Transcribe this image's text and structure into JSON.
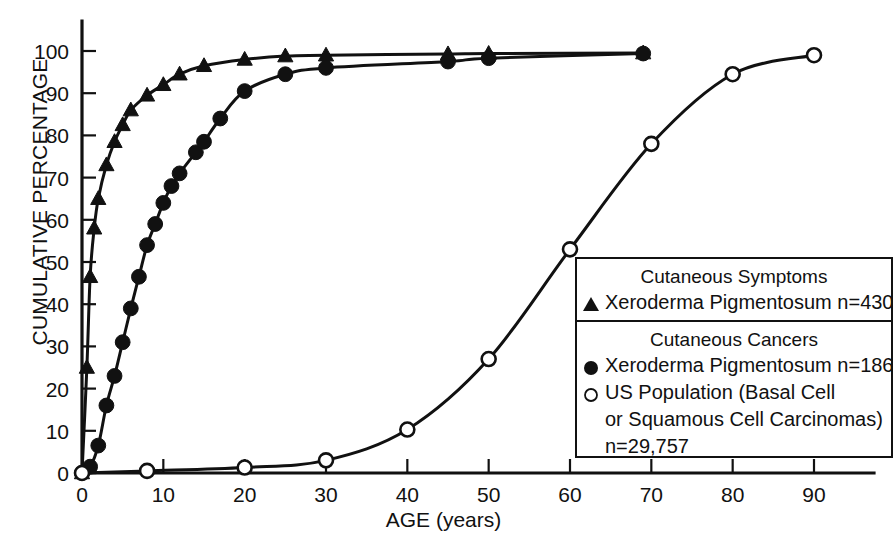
{
  "chart_data": {
    "type": "line",
    "title": "",
    "xlabel": "AGE (years)",
    "ylabel": "CUMULATIVE PERCENTAGE",
    "xlim": [
      0,
      95
    ],
    "ylim": [
      0,
      103
    ],
    "xticks": [
      0,
      10,
      20,
      30,
      40,
      50,
      60,
      70,
      80,
      90
    ],
    "yticks": [
      0,
      10,
      20,
      30,
      40,
      50,
      60,
      70,
      80,
      90,
      100
    ],
    "grid": false,
    "legend_position": "lower-right",
    "series": [
      {
        "name": "Xeroderma Pigmentosum n=430",
        "group": "Cutaneous Symptoms",
        "marker": "filled-triangle",
        "x": [
          0,
          0.6,
          1,
          1.5,
          2,
          3,
          4,
          5,
          6,
          8,
          10,
          12,
          15,
          20,
          25,
          30,
          45,
          50,
          69
        ],
        "y": [
          0,
          25,
          46.5,
          58,
          65,
          73,
          78.5,
          82.5,
          86,
          89.5,
          92,
          94.5,
          96.5,
          98,
          98.8,
          99,
          99.3,
          99.4,
          99.5
        ]
      },
      {
        "name": "Xeroderma Pigmentosum n=186",
        "group": "Cutaneous Cancers",
        "marker": "filled-circle",
        "x": [
          0,
          1,
          2,
          3,
          4,
          5,
          6,
          7,
          8,
          9,
          10,
          11,
          12,
          14,
          15,
          17,
          20,
          25,
          30,
          45,
          50,
          69
        ],
        "y": [
          0,
          1.5,
          6.5,
          16,
          23,
          31,
          39,
          46.5,
          54,
          59,
          64,
          68,
          71,
          76,
          78.5,
          84,
          90.5,
          94.5,
          96,
          97.5,
          98.3,
          99.4
        ]
      },
      {
        "name": "US Population (Basal Cell or Squamous Cell Carcinomas) n=29,757",
        "group": "Cutaneous Cancers",
        "marker": "open-circle",
        "x": [
          0,
          8,
          20,
          30,
          40,
          50,
          60,
          70,
          80,
          90
        ],
        "y": [
          0,
          0.5,
          1.3,
          3,
          10.3,
          27,
          53,
          78,
          94.5,
          99
        ]
      }
    ]
  },
  "legend": {
    "section_1": {
      "heading": "Cutaneous Symptoms",
      "rows": [
        {
          "symbol": "filled-triangle",
          "label": "Xeroderma Pigmentosum n=430"
        }
      ]
    },
    "section_2": {
      "heading": "Cutaneous Cancers",
      "rows": [
        {
          "symbol": "filled-circle",
          "label": "Xeroderma Pigmentosum n=186"
        },
        {
          "symbol": "open-circle",
          "label": "US Population (Basal Cell"
        }
      ],
      "continuation_1": "or Squamous Cell Carcinomas)",
      "continuation_2": "n=29,757"
    }
  }
}
